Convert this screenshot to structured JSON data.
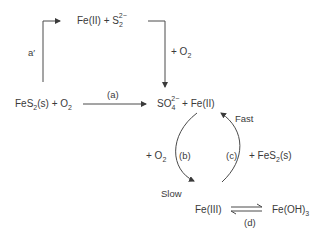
{
  "diagram": {
    "top_species": {
      "main": "Fe(II) + S",
      "sub": "2",
      "sup": "2−"
    },
    "path_a_prime_label": "a′",
    "top_right_reagent": {
      "main": "+ O",
      "sub": "2"
    },
    "reactant": {
      "main1": "FeS",
      "sub1": "2",
      "main2": "(s) + O",
      "sub2": "2"
    },
    "path_a_label": "(a)",
    "product": {
      "main1": "SO",
      "sub": "4",
      "sup": "2−",
      "main2": " + Fe(II)"
    },
    "cycle": {
      "left_reagent": {
        "main": "+ O",
        "sub": "2"
      },
      "b_label": "(b)",
      "c_label": "(c)",
      "right_reagent": {
        "main1": "+ FeS",
        "sub": "2",
        "main2": "(s)"
      },
      "fast_label": "Fast",
      "slow_label": "Slow"
    },
    "fe3": "Fe(III)",
    "hydroxide": {
      "main": "Fe(OH)",
      "sub": "3"
    },
    "d_label": "(d)"
  }
}
